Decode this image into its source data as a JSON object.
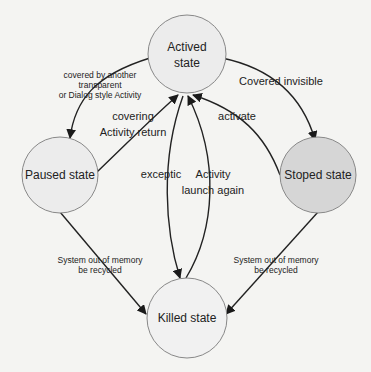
{
  "diagram": {
    "nodes": [
      {
        "id": "actived",
        "label_line1": "Actived",
        "label_line2": "state",
        "fill": "#ececec"
      },
      {
        "id": "paused",
        "label": "Paused state",
        "fill": "#ececec"
      },
      {
        "id": "stoped",
        "label": "Stoped state",
        "fill": "#d6d6d6"
      },
      {
        "id": "killed",
        "label": "Killed state",
        "fill": "#f1f1f1"
      }
    ],
    "edges": [
      {
        "from": "actived",
        "to": "paused",
        "label_lines": [
          "covered by another",
          "transparent",
          "or Dialog style Activity"
        ]
      },
      {
        "from": "paused",
        "to": "actived",
        "label_lines": [
          "covering",
          "Activity return"
        ]
      },
      {
        "from": "actived",
        "to": "stoped",
        "label_lines": [
          "Covered invisible"
        ]
      },
      {
        "from": "stoped",
        "to": "actived",
        "label_lines": [
          "activate"
        ]
      },
      {
        "from": "actived",
        "to": "killed",
        "label_lines": [
          "exceptic"
        ]
      },
      {
        "from": "killed",
        "to": "actived",
        "label_lines": [
          "Activity",
          "launch again"
        ]
      },
      {
        "from": "paused",
        "to": "killed",
        "label_lines": [
          "System out of memory",
          "be recycled"
        ]
      },
      {
        "from": "stoped",
        "to": "killed",
        "label_lines": [
          "System out of memory",
          "be recycled"
        ]
      }
    ]
  }
}
